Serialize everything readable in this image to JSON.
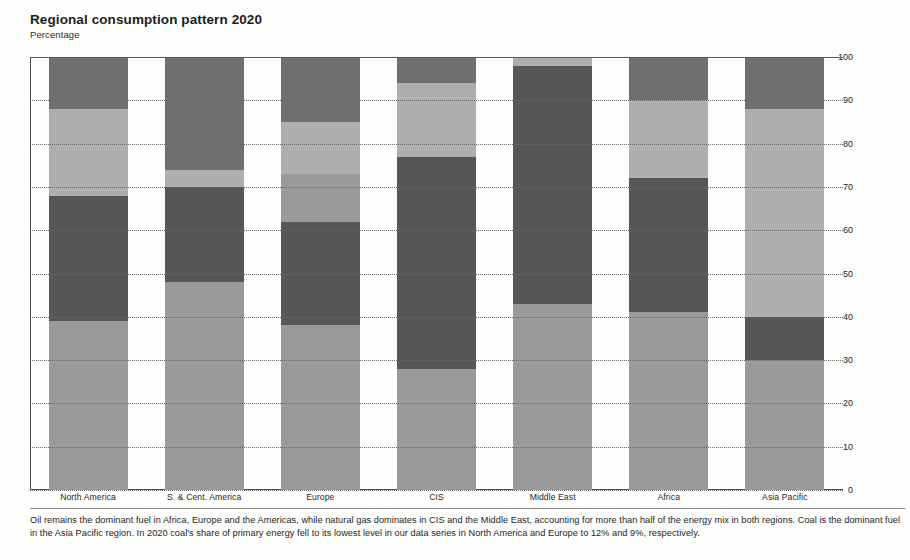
{
  "header": {
    "title": "Regional consumption pattern 2020",
    "subtitle": "Percentage"
  },
  "footnote": "Oil remains the dominant fuel in Africa, Europe and the Americas, while natural gas dominates in CIS and the Middle East, accounting for more than half of the energy mix in both regions. Coal is the dominant fuel in the Asia Pacific region. In 2020 coal's share of primary energy fell to its lowest level in our data series in North America and Europe to 12% and 9%, respectively.",
  "colors": {
    "oil": "#9a9a9a",
    "gas": "#565656",
    "coal": "#aeaeae",
    "nuclear": "#8e8e8e",
    "hydro_renewables": "#6f6f6f",
    "axis": "#4a4a4a",
    "grid": "#6a6a6a",
    "text": "#1d1d1d"
  },
  "chart_data": {
    "type": "bar",
    "title": "Regional consumption pattern 2020",
    "subtitle": "Percentage",
    "xlabel": "",
    "ylabel": "Percentage",
    "ylim": [
      0,
      100
    ],
    "yticks": [
      0,
      10,
      20,
      30,
      40,
      50,
      60,
      70,
      80,
      90,
      100
    ],
    "ytick_labels": [
      "0",
      "10",
      "20",
      "30",
      "40",
      "50",
      "60",
      "70",
      "80",
      "90",
      "100"
    ],
    "axis_position": "right",
    "grid": true,
    "stacked": true,
    "legend": "none",
    "categories": [
      "North America",
      "S. & Cent. America",
      "Europe",
      "CIS",
      "Middle East",
      "Africa",
      "Asia Pacific"
    ],
    "series": [
      {
        "name": "Oil",
        "color": "#9a9a9a",
        "values": [
          39,
          48,
          38,
          28,
          43,
          41,
          30
        ]
      },
      {
        "name": "Coal",
        "color": "#565656",
        "values": [
          12,
          4,
          12,
          5,
          1,
          22,
          48
        ]
      },
      {
        "name": "Natural Gas",
        "color": "#aeaeae",
        "values": [
          17,
          22,
          24,
          49,
          54,
          9,
          10
        ]
      },
      {
        "name": "Nuclear",
        "color": "#8e8e8e",
        "values": [
          20,
          4,
          11,
          12,
          0,
          18,
          2
        ]
      },
      {
        "name": "Hydro & Renewables",
        "color": "#6f6f6f",
        "values": [
          12,
          22,
          15,
          6,
          2,
          10,
          10
        ]
      }
    ],
    "stack_order_bottom_to_top": [
      "Oil",
      "Coal",
      "Natural Gas",
      "Nuclear",
      "Hydro & Renewables"
    ],
    "segments_by_region": [
      {
        "region": "North America",
        "segments_top_to_bottom": [
          {
            "name": "Hydro & Renewables",
            "value": 12,
            "top": 100,
            "bottom": 88,
            "color": "#6f6f6f"
          },
          {
            "name": "Nuclear",
            "value": 20,
            "top": 88,
            "bottom": 68,
            "color": "#aeaeae"
          },
          {
            "name": "Natural Gas",
            "value": 29,
            "top": 68,
            "bottom": 39,
            "color": "#565656"
          },
          {
            "name": "Oil",
            "value": 39,
            "top": 39,
            "bottom": 0,
            "color": "#9a9a9a"
          }
        ]
      },
      {
        "region": "S. & Cent. America",
        "segments_top_to_bottom": [
          {
            "name": "Hydro & Renewables",
            "value": 26,
            "top": 100,
            "bottom": 74,
            "color": "#6f6f6f"
          },
          {
            "name": "Nuclear",
            "value": 4,
            "top": 74,
            "bottom": 70,
            "color": "#aeaeae"
          },
          {
            "name": "Natural Gas",
            "value": 22,
            "top": 70,
            "bottom": 48,
            "color": "#565656"
          },
          {
            "name": "Oil",
            "value": 48,
            "top": 48,
            "bottom": 0,
            "color": "#9a9a9a"
          }
        ]
      },
      {
        "region": "Europe",
        "segments_top_to_bottom": [
          {
            "name": "Hydro & Renewables",
            "value": 15,
            "top": 100,
            "bottom": 85,
            "color": "#6f6f6f"
          },
          {
            "name": "Nuclear",
            "value": 12,
            "top": 85,
            "bottom": 73,
            "color": "#aeaeae"
          },
          {
            "name": "Coal",
            "value": 11,
            "top": 73,
            "bottom": 62,
            "color": "#9a9a9a"
          },
          {
            "name": "Natural Gas",
            "value": 24,
            "top": 62,
            "bottom": 38,
            "color": "#565656"
          },
          {
            "name": "Oil",
            "value": 38,
            "top": 38,
            "bottom": 0,
            "color": "#9a9a9a"
          }
        ]
      },
      {
        "region": "CIS",
        "segments_top_to_bottom": [
          {
            "name": "Hydro & Renewables",
            "value": 6,
            "top": 100,
            "bottom": 94,
            "color": "#6f6f6f"
          },
          {
            "name": "Nuclear",
            "value": 17,
            "top": 94,
            "bottom": 77,
            "color": "#aeaeae"
          },
          {
            "name": "Natural Gas",
            "value": 49,
            "top": 77,
            "bottom": 28,
            "color": "#565656"
          },
          {
            "name": "Oil",
            "value": 28,
            "top": 28,
            "bottom": 0,
            "color": "#9a9a9a"
          }
        ]
      },
      {
        "region": "Middle East",
        "segments_top_to_bottom": [
          {
            "name": "Hydro & Renewables",
            "value": 2,
            "top": 100,
            "bottom": 98,
            "color": "#aeaeae"
          },
          {
            "name": "Natural Gas",
            "value": 55,
            "top": 98,
            "bottom": 43,
            "color": "#565656"
          },
          {
            "name": "Oil",
            "value": 43,
            "top": 43,
            "bottom": 0,
            "color": "#9a9a9a"
          }
        ]
      },
      {
        "region": "Africa",
        "segments_top_to_bottom": [
          {
            "name": "Hydro & Renewables",
            "value": 10,
            "top": 100,
            "bottom": 90,
            "color": "#6f6f6f"
          },
          {
            "name": "Nuclear",
            "value": 18,
            "top": 90,
            "bottom": 72,
            "color": "#aeaeae"
          },
          {
            "name": "Natural Gas",
            "value": 31,
            "top": 72,
            "bottom": 41,
            "color": "#565656"
          },
          {
            "name": "Oil",
            "value": 41,
            "top": 41,
            "bottom": 0,
            "color": "#9a9a9a"
          }
        ]
      },
      {
        "region": "Asia Pacific",
        "segments_top_to_bottom": [
          {
            "name": "Hydro & Renewables",
            "value": 12,
            "top": 100,
            "bottom": 88,
            "color": "#6f6f6f"
          },
          {
            "name": "Coal",
            "value": 48,
            "top": 88,
            "bottom": 40,
            "color": "#aeaeae"
          },
          {
            "name": "Natural Gas",
            "value": 10,
            "top": 40,
            "bottom": 30,
            "color": "#565656"
          },
          {
            "name": "Oil",
            "value": 30,
            "top": 30,
            "bottom": 0,
            "color": "#9a9a9a"
          }
        ]
      }
    ]
  }
}
